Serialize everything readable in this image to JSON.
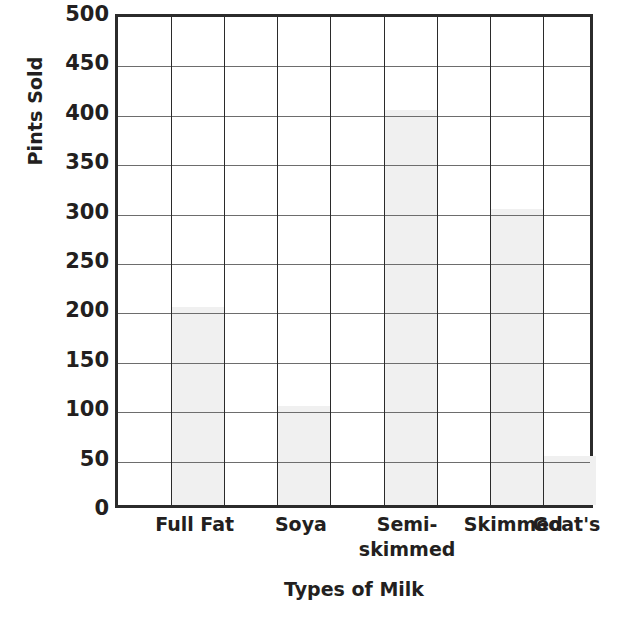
{
  "chart_data": {
    "type": "bar",
    "title": "",
    "xlabel": "Types of Milk",
    "ylabel": "Pints Sold",
    "categories": [
      "Full Fat",
      "Soya",
      "Semi-skimmed",
      "Skimmed",
      "Goat's"
    ],
    "category_labels_display": [
      "Full Fat",
      "Soya",
      "Semi-\nskimmed",
      "Skimmed",
      "Goat's"
    ],
    "values": [
      200,
      100,
      400,
      300,
      50
    ],
    "ylim": [
      0,
      500
    ],
    "ytick_step": 50,
    "ytick_labels": [
      "500",
      "450",
      "400",
      "350",
      "300",
      "250",
      "200",
      "150",
      "100",
      "50",
      "0"
    ],
    "ytick_values": [
      500,
      450,
      400,
      350,
      300,
      250,
      200,
      150,
      100,
      50,
      0
    ],
    "grid": true,
    "grid_columns": 9,
    "grid_rows": 10,
    "bar_columns": [
      2,
      4,
      6,
      8,
      9
    ],
    "legend": null,
    "bar_fill_color": "#f0f0f0",
    "bar_border_color": "#2b2b2b",
    "axis_color": "#2b2b2b",
    "grid_color": "#6d6d6d",
    "text_color": "#231f20",
    "background_color": "#ffffff"
  }
}
